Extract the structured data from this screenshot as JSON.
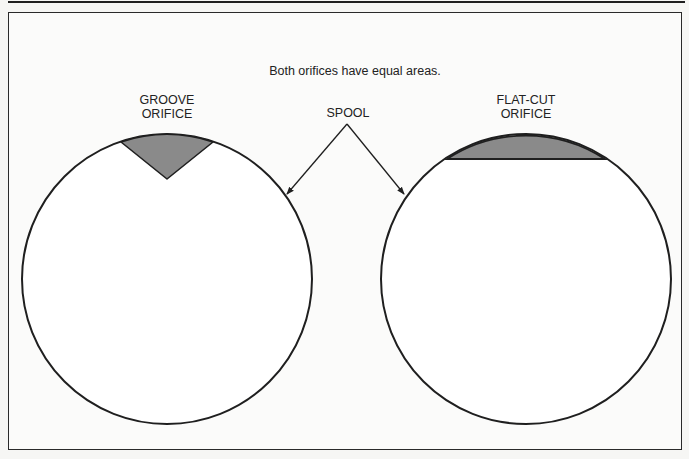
{
  "figure": {
    "caption": "Both orifices have equal areas.",
    "labels": {
      "groove": "GROOVE\nORIFICE",
      "flat_cut": "FLAT-CUT\nORIFICE",
      "spool": "SPOOL"
    },
    "shapes": {
      "left_spool": {
        "cx": 167,
        "cy": 279,
        "r": 145,
        "orifice": "groove",
        "fill": "#8a8a8a"
      },
      "right_spool": {
        "cx": 526,
        "cy": 279,
        "r": 145,
        "orifice": "flat-cut",
        "fill": "#8a8a8a"
      }
    },
    "colors": {
      "line": "#1f1f1f",
      "orifice_fill": "#8a8a8a",
      "background": "#fbfbfa"
    }
  }
}
